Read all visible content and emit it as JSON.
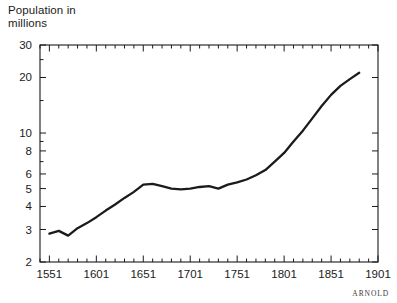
{
  "credit": "ARNOLD",
  "axis_title_line1": "Population in",
  "axis_title_line2": "millions",
  "chart_data": {
    "type": "line",
    "title": "",
    "subtitle": "",
    "xlabel": "",
    "ylabel": "Population in millions",
    "yscale": "log",
    "ylim": [
      2,
      30
    ],
    "xlim": [
      1541,
      1901
    ],
    "grid": false,
    "legend": "none",
    "annotations": [
      "ARNOLD"
    ],
    "ytick_labels": [
      "30",
      "20",
      "10",
      "8",
      "6",
      "5",
      "4",
      "3",
      "2"
    ],
    "ytick_values": [
      30,
      20,
      10,
      8,
      6,
      5,
      4,
      3,
      2
    ],
    "xtick_labels": [
      "1551",
      "1601",
      "1651",
      "1701",
      "1751",
      "1801",
      "1851",
      "1901"
    ],
    "xtick_values": [
      1551,
      1601,
      1651,
      1701,
      1751,
      1801,
      1851,
      1901
    ],
    "xminor_step": 10,
    "series": [
      {
        "name": "Population of England",
        "x": [
          1551,
          1561,
          1571,
          1581,
          1591,
          1601,
          1611,
          1621,
          1631,
          1641,
          1651,
          1661,
          1671,
          1681,
          1691,
          1701,
          1711,
          1721,
          1731,
          1741,
          1751,
          1761,
          1771,
          1781,
          1791,
          1801,
          1811,
          1821,
          1831,
          1841,
          1851,
          1861,
          1871,
          1881
        ],
        "values": [
          2.85,
          2.95,
          2.78,
          3.05,
          3.25,
          3.5,
          3.8,
          4.1,
          4.45,
          4.8,
          5.25,
          5.3,
          5.15,
          5.0,
          4.95,
          5.0,
          5.1,
          5.15,
          5.0,
          5.25,
          5.4,
          5.6,
          5.9,
          6.3,
          7.0,
          7.8,
          9.0,
          10.3,
          12.0,
          14.0,
          16.1,
          18.0,
          19.6,
          21.2
        ]
      }
    ]
  }
}
